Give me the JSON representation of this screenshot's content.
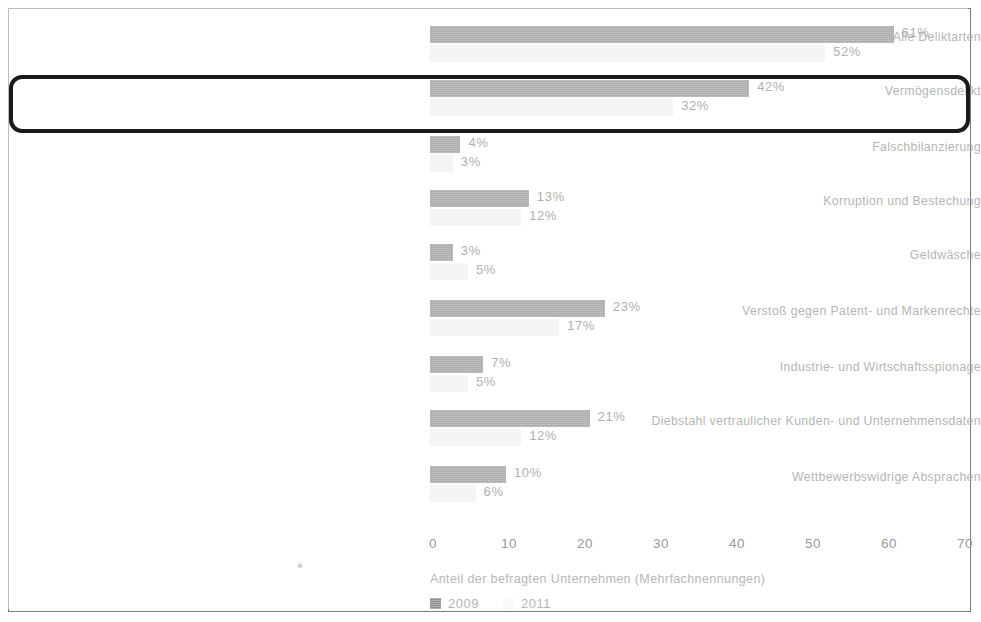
{
  "chart_data": {
    "type": "bar",
    "orientation": "horizontal",
    "title": "",
    "subtitle": "",
    "xlabel": "Anteil der befragten Unternehmen (Mehrfachnennungen)",
    "ylabel": "",
    "xlim": [
      0,
      70
    ],
    "xticks": [
      "0",
      "10",
      "20",
      "30",
      "40",
      "50",
      "60",
      "70"
    ],
    "grid": false,
    "legend_position": "bottom-left",
    "categories": [
      "Alle Deliktarten",
      "Vermögensdelikt",
      "Falschbilanzierung",
      "Korruption und Bestechung",
      "Geldwäsche",
      "Verstoß gegen Patent- und Markenrechte",
      "Industrie- und Wirtschaftsspionage",
      "Diebstahl vertraulicher Kunden- und Unternehmensdaten",
      "Wettbewerbswidrige Absprachen"
    ],
    "series": [
      {
        "name": "2009",
        "color": "#a9a9a9",
        "values": [
          61,
          42,
          4,
          13,
          3,
          23,
          7,
          21,
          10
        ],
        "labels": [
          "61%",
          "42%",
          "4%",
          "13%",
          "3%",
          "23%",
          "7%",
          "21%",
          "10%"
        ]
      },
      {
        "name": "2011",
        "color": "#f1f1f1",
        "values": [
          52,
          32,
          3,
          12,
          5,
          17,
          5,
          12,
          6
        ],
        "labels": [
          "52%",
          "32%",
          "3%",
          "12%",
          "5%",
          "17%",
          "5%",
          "12%",
          "6%"
        ]
      }
    ],
    "highlighted_category": "Vermögensdelikt",
    "footnote_marker": "*"
  },
  "legend": [
    {
      "label": "2009",
      "swatch": "solid-gray-swatch"
    },
    {
      "label": "2011",
      "swatch": "light-gray-swatch"
    }
  ]
}
